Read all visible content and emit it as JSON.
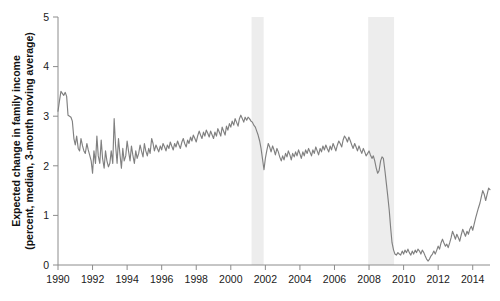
{
  "chart_data": {
    "type": "line",
    "title": "",
    "xlabel": "",
    "ylabel_line1": "Expected change in family income",
    "ylabel_line2": "(percent, median, 3-month moving average)",
    "xlim": [
      1990.0,
      2015.0
    ],
    "ylim": [
      0,
      5
    ],
    "ytick_labels": [
      "0",
      "1",
      "2",
      "3",
      "4",
      "5"
    ],
    "ytick_values": [
      0,
      1,
      2,
      3,
      4,
      5
    ],
    "xtick_labels": [
      "1990",
      "1992",
      "1994",
      "1996",
      "1998",
      "2000",
      "2002",
      "2004",
      "2006",
      "2008",
      "2010",
      "2012",
      "2014"
    ],
    "xtick_values": [
      1990,
      1992,
      1994,
      1996,
      1998,
      2000,
      2002,
      2004,
      2006,
      2008,
      2010,
      2012,
      2014
    ],
    "grid": false,
    "legend": "none",
    "line_color": "#808080",
    "recession_band_color": "#ededed",
    "axis_color": "#8c8c8c",
    "annotations": [
      {
        "name": "recession-band-2001",
        "x_start": 2001.2,
        "x_end": 2001.9
      },
      {
        "name": "recession-band-2008",
        "x_start": 2007.95,
        "x_end": 2009.45
      }
    ],
    "series": [
      {
        "name": "Expected change in family income",
        "x": [
          1990.0,
          1990.08,
          1990.17,
          1990.25,
          1990.33,
          1990.42,
          1990.5,
          1990.58,
          1990.67,
          1990.75,
          1990.83,
          1990.92,
          1991.0,
          1991.08,
          1991.17,
          1991.25,
          1991.33,
          1991.42,
          1991.5,
          1991.58,
          1991.67,
          1991.75,
          1991.83,
          1991.92,
          1992.0,
          1992.08,
          1992.17,
          1992.25,
          1992.33,
          1992.42,
          1992.5,
          1992.58,
          1992.67,
          1992.75,
          1992.83,
          1992.92,
          1993.0,
          1993.08,
          1993.17,
          1993.25,
          1993.33,
          1993.42,
          1993.5,
          1993.58,
          1993.67,
          1993.75,
          1993.83,
          1993.92,
          1994.0,
          1994.08,
          1994.17,
          1994.25,
          1994.33,
          1994.42,
          1994.5,
          1994.58,
          1994.67,
          1994.75,
          1994.83,
          1994.92,
          1995.0,
          1995.08,
          1995.17,
          1995.25,
          1995.33,
          1995.42,
          1995.5,
          1995.58,
          1995.67,
          1995.75,
          1995.83,
          1995.92,
          1996.0,
          1996.08,
          1996.17,
          1996.25,
          1996.33,
          1996.42,
          1996.5,
          1996.58,
          1996.67,
          1996.75,
          1996.83,
          1996.92,
          1997.0,
          1997.08,
          1997.17,
          1997.25,
          1997.33,
          1997.42,
          1997.5,
          1997.58,
          1997.67,
          1997.75,
          1997.83,
          1997.92,
          1998.0,
          1998.08,
          1998.17,
          1998.25,
          1998.33,
          1998.42,
          1998.5,
          1998.58,
          1998.67,
          1998.75,
          1998.83,
          1998.92,
          1999.0,
          1999.08,
          1999.17,
          1999.25,
          1999.33,
          1999.42,
          1999.5,
          1999.58,
          1999.67,
          1999.75,
          1999.83,
          1999.92,
          2000.0,
          2000.08,
          2000.17,
          2000.25,
          2000.33,
          2000.42,
          2000.5,
          2000.58,
          2000.67,
          2000.75,
          2000.83,
          2000.92,
          2001.0,
          2001.08,
          2001.17,
          2001.25,
          2001.33,
          2001.42,
          2001.5,
          2001.58,
          2001.67,
          2001.75,
          2001.83,
          2001.92,
          2002.0,
          2002.08,
          2002.17,
          2002.25,
          2002.33,
          2002.42,
          2002.5,
          2002.58,
          2002.67,
          2002.75,
          2002.83,
          2002.92,
          2003.0,
          2003.08,
          2003.17,
          2003.25,
          2003.33,
          2003.42,
          2003.5,
          2003.58,
          2003.67,
          2003.75,
          2003.83,
          2003.92,
          2004.0,
          2004.08,
          2004.17,
          2004.25,
          2004.33,
          2004.42,
          2004.5,
          2004.58,
          2004.67,
          2004.75,
          2004.83,
          2004.92,
          2005.0,
          2005.08,
          2005.17,
          2005.25,
          2005.33,
          2005.42,
          2005.5,
          2005.58,
          2005.67,
          2005.75,
          2005.83,
          2005.92,
          2006.0,
          2006.08,
          2006.17,
          2006.25,
          2006.33,
          2006.42,
          2006.5,
          2006.58,
          2006.67,
          2006.75,
          2006.83,
          2006.92,
          2007.0,
          2007.08,
          2007.17,
          2007.25,
          2007.33,
          2007.42,
          2007.5,
          2007.58,
          2007.67,
          2007.75,
          2007.83,
          2007.92,
          2008.0,
          2008.08,
          2008.17,
          2008.25,
          2008.33,
          2008.42,
          2008.5,
          2008.58,
          2008.67,
          2008.75,
          2008.83,
          2008.92,
          2009.0,
          2009.08,
          2009.17,
          2009.25,
          2009.33,
          2009.42,
          2009.5,
          2009.58,
          2009.67,
          2009.75,
          2009.83,
          2009.92,
          2010.0,
          2010.08,
          2010.17,
          2010.25,
          2010.33,
          2010.42,
          2010.5,
          2010.58,
          2010.67,
          2010.75,
          2010.83,
          2010.92,
          2011.0,
          2011.08,
          2011.17,
          2011.25,
          2011.33,
          2011.42,
          2011.5,
          2011.58,
          2011.67,
          2011.75,
          2011.83,
          2011.92,
          2012.0,
          2012.08,
          2012.17,
          2012.25,
          2012.33,
          2012.42,
          2012.5,
          2012.58,
          2012.67,
          2012.75,
          2012.83,
          2012.92,
          2013.0,
          2013.08,
          2013.17,
          2013.25,
          2013.33,
          2013.42,
          2013.5,
          2013.58,
          2013.67,
          2013.75,
          2013.83,
          2013.92,
          2014.0,
          2014.08,
          2014.17,
          2014.25,
          2014.33,
          2014.42,
          2014.5,
          2014.58,
          2014.67,
          2014.75,
          2014.83,
          2014.92,
          2015.0
        ],
        "y": [
          3.1,
          3.3,
          3.5,
          3.46,
          3.42,
          3.48,
          3.4,
          3.02,
          3.0,
          2.98,
          2.9,
          2.55,
          2.42,
          2.6,
          2.35,
          2.3,
          2.55,
          2.4,
          2.3,
          2.25,
          2.45,
          2.32,
          2.22,
          2.1,
          1.85,
          2.3,
          2.05,
          2.6,
          2.2,
          2.05,
          2.52,
          2.15,
          1.95,
          2.3,
          2.1,
          1.98,
          2.05,
          2.3,
          2.05,
          2.95,
          2.42,
          2.05,
          2.55,
          2.25,
          1.95,
          2.35,
          2.1,
          2.2,
          2.5,
          2.3,
          2.1,
          2.4,
          2.22,
          2.05,
          2.3,
          2.15,
          2.25,
          2.42,
          2.3,
          2.18,
          2.45,
          2.3,
          2.2,
          2.35,
          2.25,
          2.55,
          2.45,
          2.3,
          2.42,
          2.35,
          2.28,
          2.4,
          2.32,
          2.45,
          2.38,
          2.3,
          2.42,
          2.35,
          2.48,
          2.4,
          2.32,
          2.45,
          2.38,
          2.5,
          2.42,
          2.35,
          2.48,
          2.55,
          2.45,
          2.38,
          2.52,
          2.45,
          2.58,
          2.5,
          2.62,
          2.55,
          2.48,
          2.6,
          2.7,
          2.62,
          2.55,
          2.68,
          2.6,
          2.72,
          2.65,
          2.58,
          2.7,
          2.62,
          2.55,
          2.68,
          2.6,
          2.75,
          2.68,
          2.6,
          2.78,
          2.7,
          2.62,
          2.8,
          2.72,
          2.85,
          2.78,
          2.9,
          2.82,
          2.95,
          2.88,
          2.8,
          2.95,
          3.02,
          2.95,
          2.88,
          2.98,
          2.92,
          2.98,
          2.95,
          2.9,
          2.88,
          2.82,
          2.78,
          2.7,
          2.62,
          2.5,
          2.35,
          2.15,
          1.92,
          2.15,
          2.3,
          2.45,
          2.38,
          2.28,
          2.4,
          2.32,
          2.22,
          2.35,
          2.28,
          2.18,
          2.1,
          2.2,
          2.12,
          2.25,
          2.18,
          2.3,
          2.22,
          2.12,
          2.25,
          2.18,
          2.28,
          2.2,
          2.32,
          2.24,
          2.15,
          2.28,
          2.2,
          2.32,
          2.25,
          2.35,
          2.28,
          2.2,
          2.32,
          2.25,
          2.38,
          2.3,
          2.22,
          2.35,
          2.28,
          2.4,
          2.32,
          2.42,
          2.35,
          2.28,
          2.4,
          2.32,
          2.45,
          2.38,
          2.3,
          2.42,
          2.5,
          2.45,
          2.38,
          2.52,
          2.6,
          2.55,
          2.48,
          2.58,
          2.5,
          2.42,
          2.35,
          2.45,
          2.38,
          2.3,
          2.4,
          2.32,
          2.25,
          2.35,
          2.28,
          2.2,
          2.25,
          2.3,
          2.22,
          2.15,
          2.2,
          2.1,
          1.95,
          1.85,
          1.9,
          2.1,
          2.18,
          2.15,
          1.9,
          1.65,
          1.4,
          1.1,
          0.75,
          0.45,
          0.3,
          0.22,
          0.2,
          0.25,
          0.22,
          0.2,
          0.28,
          0.22,
          0.3,
          0.25,
          0.32,
          0.25,
          0.2,
          0.28,
          0.22,
          0.3,
          0.25,
          0.32,
          0.28,
          0.22,
          0.3,
          0.25,
          0.18,
          0.12,
          0.08,
          0.12,
          0.18,
          0.22,
          0.28,
          0.22,
          0.3,
          0.38,
          0.32,
          0.45,
          0.52,
          0.45,
          0.38,
          0.42,
          0.35,
          0.45,
          0.55,
          0.68,
          0.6,
          0.52,
          0.62,
          0.55,
          0.48,
          0.6,
          0.72,
          0.65,
          0.58,
          0.68,
          0.62,
          0.72,
          0.78,
          0.7,
          0.82,
          0.95,
          1.05,
          1.15,
          1.25,
          1.38,
          1.5,
          1.42,
          1.3,
          1.42,
          1.55,
          1.52
        ]
      }
    ]
  }
}
